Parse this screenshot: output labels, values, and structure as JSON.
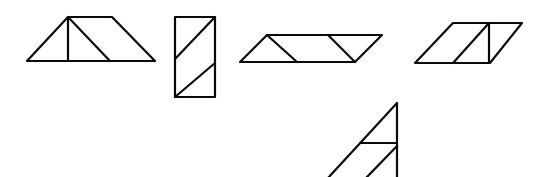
{
  "diagram": {
    "line_color": "#0a0a0a",
    "background_color": "#ffffff",
    "figures": [
      {
        "name": "trapezoid",
        "parts": [
          "right triangle",
          "right triangle",
          "triangle"
        ]
      },
      {
        "name": "rectangle",
        "parts": [
          "right triangle",
          "parallelogram",
          "right triangle"
        ]
      },
      {
        "name": "parallelogram-wide",
        "parts": [
          "triangle",
          "parallelogram",
          "triangle"
        ]
      },
      {
        "name": "parallelogram-slanted",
        "parts": [
          "parallelogram",
          "right triangle"
        ]
      },
      {
        "name": "triangle-partial",
        "parts": [
          "right triangle",
          "trapezoid"
        ]
      }
    ]
  }
}
